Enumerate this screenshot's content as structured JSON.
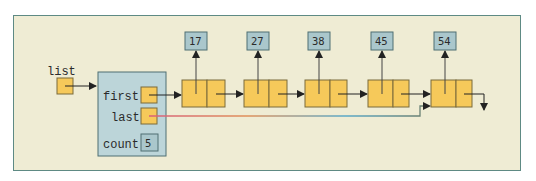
{
  "diagram": {
    "colors": {
      "background": "#efecd4",
      "frame_border": "#5e8a84",
      "node_fill": "#f6c95a",
      "node_border": "#7a6a3a",
      "value_fill": "#aac7cc",
      "value_border": "#4f6f73",
      "header_fill": "#bcd5d9",
      "arrow": "#222222"
    },
    "list_variable": {
      "label": "list"
    },
    "header": {
      "fields": [
        {
          "label": "first"
        },
        {
          "label": "last"
        },
        {
          "label": "count",
          "value": "5"
        }
      ]
    },
    "nodes": [
      {
        "value": "17"
      },
      {
        "value": "27"
      },
      {
        "value": "38"
      },
      {
        "value": "45"
      },
      {
        "value": "54"
      }
    ]
  }
}
